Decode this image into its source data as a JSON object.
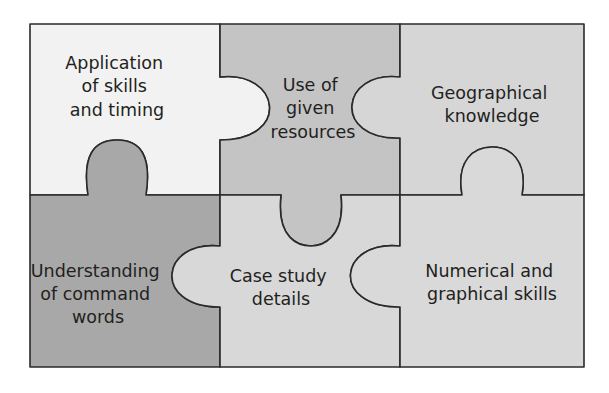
{
  "diagram": {
    "type": "jigsaw-puzzle",
    "grid": {
      "rows": 2,
      "cols": 3
    },
    "pieces": [
      {
        "id": "top-left",
        "lines": [
          "Application",
          "of skills",
          "and timing"
        ],
        "fill": "#f2f2f2"
      },
      {
        "id": "top-middle",
        "lines": [
          "Use of",
          "given",
          "resources"
        ],
        "fill": "#c4c4c4"
      },
      {
        "id": "top-right",
        "lines": [
          "Geographical",
          "knowledge"
        ],
        "fill": "#d6d6d6"
      },
      {
        "id": "bottom-left",
        "lines": [
          "Understanding",
          "of command",
          "words"
        ],
        "fill": "#a8a8a8"
      },
      {
        "id": "bottom-middle",
        "lines": [
          "Case study",
          "details"
        ],
        "fill": "#d8d8d8"
      },
      {
        "id": "bottom-right",
        "lines": [
          "Numerical and",
          "graphical skills"
        ],
        "fill": "#d9d9d9"
      }
    ],
    "outline_color": "#2a2a2a"
  }
}
